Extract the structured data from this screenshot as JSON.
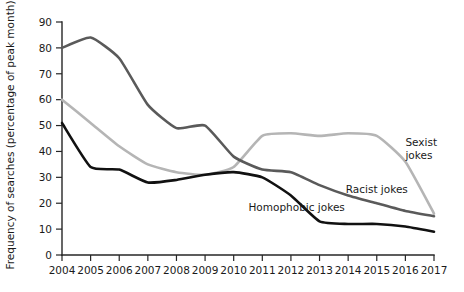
{
  "chart_data": {
    "type": "line",
    "title": "",
    "xlabel": "",
    "ylabel": "Frequency of searches (percentage of peak month)",
    "xlim": [
      2004,
      2017
    ],
    "ylim": [
      0,
      90
    ],
    "ytick_step": 10,
    "grid": false,
    "legend_position": "inline-right",
    "x": [
      2004,
      2005,
      2006,
      2007,
      2008,
      2009,
      2010,
      2011,
      2012,
      2013,
      2014,
      2015,
      2016,
      2017
    ],
    "xticklabels": [
      "2004",
      "2005",
      "2006",
      "2007",
      "2008",
      "2009",
      "2010",
      "2011",
      "2012",
      "2013",
      "2014",
      "2015",
      "2016",
      "2017"
    ],
    "yticklabels": [
      "0",
      "10",
      "20",
      "30",
      "40",
      "50",
      "60",
      "70",
      "80",
      "90"
    ],
    "yticks": [
      0,
      10,
      20,
      30,
      40,
      50,
      60,
      70,
      80,
      90
    ],
    "series": [
      {
        "name": "Racist jokes",
        "color": "#5a5a5a",
        "label": "Racist jokes",
        "values": [
          80,
          84,
          76,
          58,
          49,
          50,
          38,
          33,
          32,
          27,
          23,
          20,
          17,
          15
        ]
      },
      {
        "name": "Sexist jokes",
        "color": "#b5b5b5",
        "label": "Sexist jokes",
        "values": [
          60,
          51,
          42,
          35,
          32,
          31,
          34,
          46,
          47,
          46,
          47,
          46,
          36,
          16
        ]
      },
      {
        "name": "Homophobic jokes",
        "color": "#111111",
        "label": "Homophobic jokes",
        "values": [
          51,
          34,
          33,
          28,
          29,
          31,
          32,
          30,
          23,
          13,
          12,
          12,
          11,
          9
        ]
      }
    ],
    "annotations": [
      {
        "text": "Sexist jokes",
        "series": "Sexist jokes",
        "x": 2016.0,
        "y": 42
      },
      {
        "text": "Racist jokes",
        "series": "Racist jokes",
        "x": 2015.0,
        "y": 24
      },
      {
        "text": "Homophobic jokes",
        "series": "Homophobic jokes",
        "x": 2012.2,
        "y": 17
      }
    ]
  }
}
